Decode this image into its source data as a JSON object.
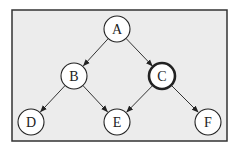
{
  "diagram": {
    "type": "directed-graph",
    "frame": {
      "background": "#ececec",
      "border": "#333333"
    },
    "nodes": [
      {
        "id": "A",
        "label": "A",
        "x": 117,
        "y": 29,
        "highlighted": false
      },
      {
        "id": "B",
        "label": "B",
        "x": 74,
        "y": 76,
        "highlighted": false
      },
      {
        "id": "C",
        "label": "C",
        "x": 162,
        "y": 76,
        "highlighted": true
      },
      {
        "id": "D",
        "label": "D",
        "x": 31,
        "y": 122,
        "highlighted": false
      },
      {
        "id": "E",
        "label": "E",
        "x": 117,
        "y": 122,
        "highlighted": false
      },
      {
        "id": "F",
        "label": "F",
        "x": 208,
        "y": 122,
        "highlighted": false
      }
    ],
    "edges": [
      {
        "from": "A",
        "to": "B"
      },
      {
        "from": "A",
        "to": "C"
      },
      {
        "from": "B",
        "to": "D"
      },
      {
        "from": "B",
        "to": "E"
      },
      {
        "from": "C",
        "to": "E"
      },
      {
        "from": "C",
        "to": "F"
      }
    ]
  }
}
